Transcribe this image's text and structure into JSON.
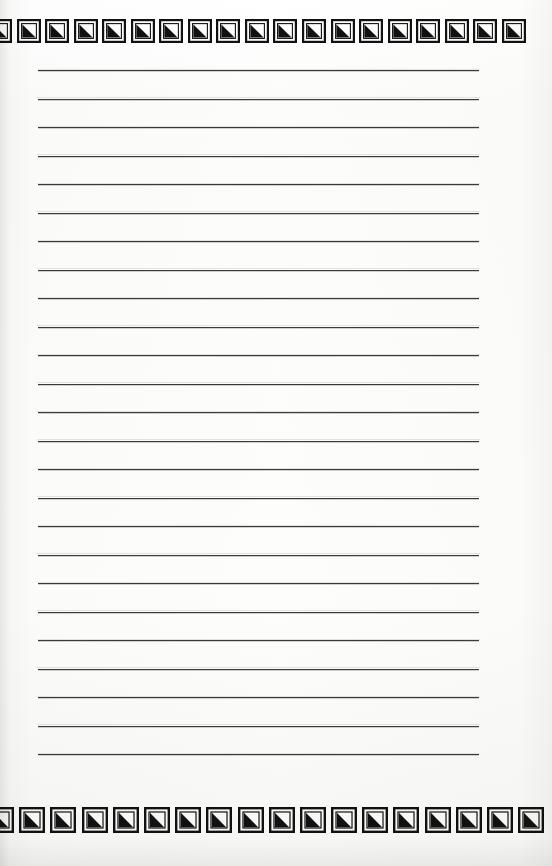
{
  "document": {
    "type": "lined-notepad-page",
    "title": "Blank lined notepad page",
    "paper_color": "#fcfcfb",
    "rule_color": "#3a3a3a",
    "glyph_color": "#111111",
    "content_text": ""
  },
  "border": {
    "glyph_name": "square-with-filled-triangle-icon",
    "glyph_description": "Square outline frame enclosing a solid black triangle filling the lower-left half",
    "top_row": {
      "label": "top decorative border",
      "glyph_count": 19,
      "first_glyph_clipped": true,
      "last_glyph_clipped": true
    },
    "bottom_row": {
      "label": "bottom decorative border",
      "glyph_count": 18,
      "first_glyph_clipped": true,
      "last_glyph_clipped": false
    }
  },
  "rules": {
    "label": "ruled writing lines",
    "line_count": 25,
    "line_spacing_px": 28.5,
    "first_line_y": 70,
    "left_x": 38,
    "right_x": 479,
    "lines": [
      {
        "index": 1,
        "text": ""
      },
      {
        "index": 2,
        "text": ""
      },
      {
        "index": 3,
        "text": ""
      },
      {
        "index": 4,
        "text": ""
      },
      {
        "index": 5,
        "text": ""
      },
      {
        "index": 6,
        "text": ""
      },
      {
        "index": 7,
        "text": ""
      },
      {
        "index": 8,
        "text": ""
      },
      {
        "index": 9,
        "text": ""
      },
      {
        "index": 10,
        "text": ""
      },
      {
        "index": 11,
        "text": ""
      },
      {
        "index": 12,
        "text": ""
      },
      {
        "index": 13,
        "text": ""
      },
      {
        "index": 14,
        "text": ""
      },
      {
        "index": 15,
        "text": ""
      },
      {
        "index": 16,
        "text": ""
      },
      {
        "index": 17,
        "text": ""
      },
      {
        "index": 18,
        "text": ""
      },
      {
        "index": 19,
        "text": ""
      },
      {
        "index": 20,
        "text": ""
      },
      {
        "index": 21,
        "text": ""
      },
      {
        "index": 22,
        "text": ""
      },
      {
        "index": 23,
        "text": ""
      },
      {
        "index": 24,
        "text": ""
      },
      {
        "index": 25,
        "text": ""
      }
    ]
  }
}
